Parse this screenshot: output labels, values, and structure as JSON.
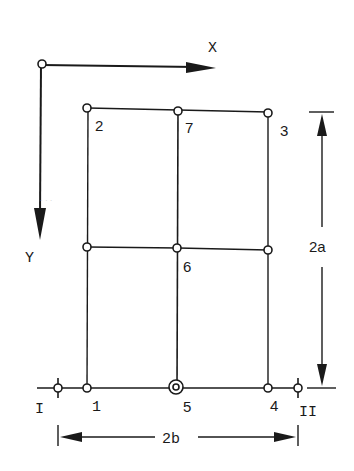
{
  "diagram": {
    "type": "plate-grid-node-diagram",
    "axes": {
      "x_label": "X",
      "y_label": "Y"
    },
    "nodes": [
      {
        "id": "1",
        "label": "1"
      },
      {
        "id": "2",
        "label": "2"
      },
      {
        "id": "3",
        "label": "3"
      },
      {
        "id": "4",
        "label": "4"
      },
      {
        "id": "5",
        "label": "5",
        "style": "double-circle"
      },
      {
        "id": "6",
        "label": "6"
      },
      {
        "id": "7",
        "label": "7"
      }
    ],
    "supports": [
      {
        "id": "I",
        "label": "I"
      },
      {
        "id": "II",
        "label": "II"
      }
    ],
    "dimensions": {
      "height_label": "2a",
      "width_label": "2b"
    },
    "colors": {
      "ink": "#1a1a1a",
      "background": "#ffffff"
    }
  }
}
